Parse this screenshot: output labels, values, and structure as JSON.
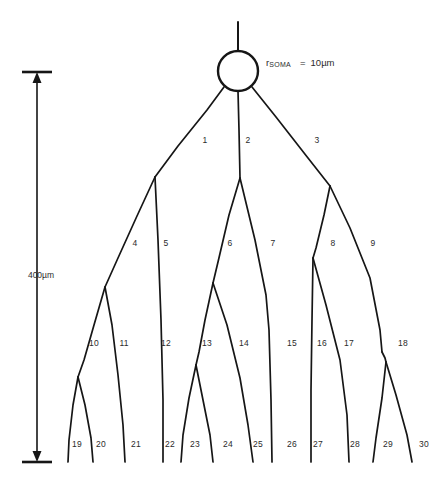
{
  "figure": {
    "type": "neuron-dendrite-branching-diagram",
    "background_color": "#ffffff",
    "line_color": "#161616",
    "text_color": "#2b2b2b"
  },
  "soma": {
    "label_r": "r",
    "label_subscript": "SOMA",
    "label_equals": "=",
    "label_value": "10µm",
    "radius_px": 20,
    "center_x": 238,
    "center_y": 71
  },
  "scale_bar": {
    "label": "400µm",
    "x": 37,
    "top_y": 72,
    "bottom_y": 462,
    "label_x": 41,
    "label_y": 275
  },
  "segment_labels": [
    {
      "id": "1",
      "x": 205,
      "y": 140
    },
    {
      "id": "2",
      "x": 248,
      "y": 140
    },
    {
      "id": "3",
      "x": 317,
      "y": 140
    },
    {
      "id": "4",
      "x": 135,
      "y": 243
    },
    {
      "id": "5",
      "x": 166,
      "y": 243
    },
    {
      "id": "6",
      "x": 230,
      "y": 243
    },
    {
      "id": "7",
      "x": 273,
      "y": 243
    },
    {
      "id": "8",
      "x": 333,
      "y": 243
    },
    {
      "id": "9",
      "x": 373,
      "y": 243
    },
    {
      "id": "10",
      "x": 94,
      "y": 343
    },
    {
      "id": "11",
      "x": 124,
      "y": 343
    },
    {
      "id": "12",
      "x": 166,
      "y": 343
    },
    {
      "id": "13",
      "x": 207,
      "y": 343
    },
    {
      "id": "14",
      "x": 244,
      "y": 343
    },
    {
      "id": "15",
      "x": 292,
      "y": 343
    },
    {
      "id": "16",
      "x": 322,
      "y": 343
    },
    {
      "id": "17",
      "x": 349,
      "y": 343
    },
    {
      "id": "18",
      "x": 403,
      "y": 343
    },
    {
      "id": "19",
      "x": 77,
      "y": 444
    },
    {
      "id": "20",
      "x": 101,
      "y": 444
    },
    {
      "id": "21",
      "x": 136,
      "y": 444
    },
    {
      "id": "22",
      "x": 170,
      "y": 444
    },
    {
      "id": "23",
      "x": 195,
      "y": 444
    },
    {
      "id": "24",
      "x": 228,
      "y": 444
    },
    {
      "id": "25",
      "x": 258,
      "y": 444
    },
    {
      "id": "26",
      "x": 292,
      "y": 444
    },
    {
      "id": "27",
      "x": 318,
      "y": 444
    },
    {
      "id": "28",
      "x": 355,
      "y": 444
    },
    {
      "id": "29",
      "x": 388,
      "y": 444
    },
    {
      "id": "30",
      "x": 424,
      "y": 444
    }
  ],
  "branches": [
    {
      "id": "apical-trunk",
      "d": "M 238 22 L 238 51"
    },
    {
      "id": "soma-to-node1",
      "d": "M 224 86 L 155 177"
    },
    {
      "id": "soma-to-node2",
      "d": "M 238 91 L 240 178"
    },
    {
      "id": "soma-to-node3",
      "d": "M 252 86 L 330 186"
    },
    {
      "id": "seg4",
      "d": "M 155 177 L 105 287"
    },
    {
      "id": "seg5",
      "d": "M 155 177 L 160 300 L 163 400 L 163 462"
    },
    {
      "id": "seg6",
      "d": "M 240 178 L 213 283"
    },
    {
      "id": "seg7",
      "d": "M 240 178 L 268 310 L 272 390 L 272 462"
    },
    {
      "id": "seg8",
      "d": "M 330 186 L 313 258"
    },
    {
      "id": "seg9",
      "d": "M 330 186 L 372 280 L 382 350"
    },
    {
      "id": "seg10",
      "d": "M 105 287 L 78 377"
    },
    {
      "id": "seg11",
      "d": "M 105 287 L 118 370 L 124 430 L 125 462"
    },
    {
      "id": "seg12",
      "d": "M 163 400 L 163 462"
    },
    {
      "id": "seg13",
      "d": "M 213 283 L 196 365"
    },
    {
      "id": "seg14",
      "d": "M 213 283 L 240 370 L 251 440 L 253 462"
    },
    {
      "id": "seg15",
      "d": "M 268 310 L 272 390 L 272 462"
    },
    {
      "id": "seg16",
      "d": "M 313 258 L 311 360 L 311 462"
    },
    {
      "id": "seg17",
      "d": "M 313 258 L 341 350 L 348 420 L 349 462"
    },
    {
      "id": "seg18",
      "d": "M 382 350 L 386 362"
    },
    {
      "id": "seg19",
      "d": "M 78 377 L 70 420 L 68 462"
    },
    {
      "id": "seg20",
      "d": "M 78 377 L 91 425 L 93 462"
    },
    {
      "id": "seg22",
      "d": "M 196 365 L 184 410 L 181 462"
    },
    {
      "id": "seg23",
      "d": "M 196 365 L 210 420 L 213 462"
    },
    {
      "id": "seg29",
      "d": "M 386 362 L 378 410 L 373 462"
    },
    {
      "id": "seg30",
      "d": "M 386 362 L 405 415 L 412 462"
    }
  ],
  "branch_paths_rendered": "all",
  "counts": {
    "terminal_segments": 12,
    "total_numbered_segments": 30
  }
}
